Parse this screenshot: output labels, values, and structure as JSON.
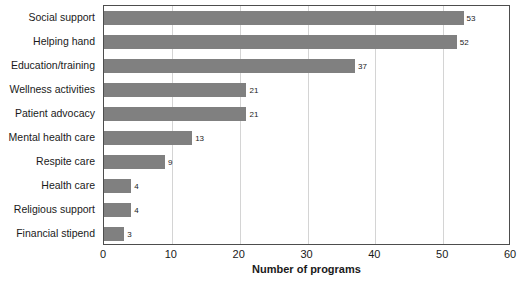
{
  "chart_data": {
    "type": "bar",
    "orientation": "horizontal",
    "title": "",
    "xlabel": "Number of programs",
    "ylabel": "",
    "xlim": [
      0,
      60
    ],
    "xticks": [
      0,
      10,
      20,
      30,
      40,
      50,
      60
    ],
    "grid": "vertical",
    "legend": "none",
    "bar_color": "#808080",
    "axis_color": "#4d4d4d",
    "gridline_color": "#d4d4d4",
    "categories": [
      "Social support",
      "Helping hand",
      "Education/training",
      "Wellness activities",
      "Patient advocacy",
      "Mental health care",
      "Respite care",
      "Health care",
      "Religious support",
      "Financial stipend"
    ],
    "values": [
      53,
      52,
      37,
      21,
      21,
      13,
      9,
      4,
      4,
      3
    ],
    "data_labels": [
      "53",
      "52",
      "37",
      "21",
      "21",
      "13",
      "9",
      "4",
      "4",
      "3"
    ],
    "xtick_labels": [
      "0",
      "10",
      "20",
      "30",
      "40",
      "50",
      "60"
    ]
  }
}
